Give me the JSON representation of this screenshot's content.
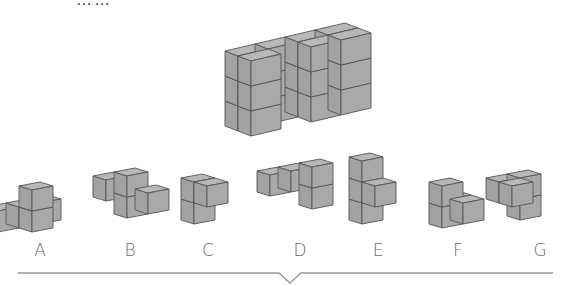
{
  "header": {
    "clipped_title": "……"
  },
  "colors": {
    "face_top": "#b8b8b8",
    "face_front": "#a9a9a9",
    "face_left": "#a2a2a2",
    "edge": "#555555",
    "baseline": "#9a9a9a",
    "label": "#6a6a6a"
  },
  "target_figure": {
    "name": "target-solid",
    "origin": [
      251,
      136
    ],
    "front": [
      30,
      -7
    ],
    "depth": [
      -13,
      -5
    ],
    "up": 25,
    "cubes": [
      [
        0,
        1,
        0
      ],
      [
        0,
        1,
        1
      ],
      [
        0,
        1,
        2
      ],
      [
        1,
        1,
        0
      ],
      [
        1,
        1,
        1
      ],
      [
        1,
        1,
        2
      ],
      [
        2,
        1,
        0
      ],
      [
        2,
        1,
        1
      ],
      [
        2,
        1,
        2
      ],
      [
        3,
        1,
        0
      ],
      [
        3,
        1,
        1
      ],
      [
        3,
        1,
        2
      ],
      [
        0,
        0,
        0
      ],
      [
        0,
        0,
        1
      ],
      [
        0,
        0,
        2
      ],
      [
        3,
        0,
        0
      ],
      [
        3,
        0,
        1
      ],
      [
        3,
        0,
        2
      ],
      [
        2,
        0,
        2
      ],
      [
        2,
        0,
        0
      ],
      [
        2,
        0,
        1
      ]
    ]
  },
  "options": [
    {
      "label": "A",
      "label_x": 40,
      "origin": [
        32,
        232
      ],
      "cubes": [
        [
          0,
          1,
          0
        ],
        [
          1,
          1,
          0
        ],
        [
          -1,
          1,
          0
        ],
        [
          0,
          0,
          0
        ],
        [
          0,
          0,
          1
        ]
      ]
    },
    {
      "label": "B",
      "label_x": 130,
      "origin": [
        106,
        222
      ],
      "cubes": [
        [
          0,
          0,
          1
        ],
        [
          1,
          0,
          1
        ],
        [
          1,
          0,
          0
        ],
        [
          2,
          0,
          0
        ]
      ]
    },
    {
      "label": "C",
      "label_x": 208,
      "origin": [
        207,
        228
      ],
      "cubes": [
        [
          0,
          1,
          0
        ],
        [
          0,
          1,
          1
        ],
        [
          0,
          0,
          1
        ]
      ]
    },
    {
      "label": "D",
      "label_x": 300,
      "origin": [
        270,
        217
      ],
      "cubes": [
        [
          0,
          0,
          1
        ],
        [
          1,
          0,
          1
        ],
        [
          2,
          0,
          1
        ],
        [
          2,
          0,
          0
        ]
      ]
    },
    {
      "label": "E",
      "label_x": 378,
      "origin": [
        375,
        228
      ],
      "cubes": [
        [
          0,
          1,
          0
        ],
        [
          0,
          1,
          1
        ],
        [
          0,
          1,
          2
        ],
        [
          0,
          0,
          1
        ]
      ]
    },
    {
      "label": "F",
      "label_x": 458,
      "origin": [
        442,
        228
      ],
      "cubes": [
        [
          1,
          1,
          0
        ],
        [
          0,
          0,
          0
        ],
        [
          1,
          0,
          0
        ],
        [
          0,
          0,
          1
        ]
      ]
    },
    {
      "label": "G",
      "label_x": 540,
      "origin": [
        512,
        228
      ],
      "cubes": [
        [
          1,
          1,
          1
        ],
        [
          1,
          1,
          0
        ],
        [
          0,
          0,
          1
        ],
        [
          0,
          1,
          1
        ]
      ]
    }
  ],
  "small_projection": {
    "front": [
      21,
      -4
    ],
    "depth": [
      -13,
      -4
    ],
    "up": 21
  },
  "baseline": {
    "x1": 18,
    "x2": 553,
    "y": 273,
    "notch_x": 290,
    "notch_w": 11,
    "notch_depth": 10
  }
}
